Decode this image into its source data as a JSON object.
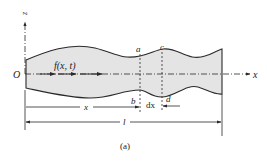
{
  "figure": {
    "caption": "(a)",
    "origin_label": "O",
    "x_axis_label": "x",
    "z_axis_label": "z",
    "force_label": "f(x, t)",
    "section_labels": {
      "a": "a",
      "b": "b",
      "c": "c",
      "d": "d"
    },
    "dimension_labels": {
      "position": "x",
      "element_width": "dx",
      "length": "l"
    }
  },
  "colors": {
    "bar_fill": "#e4e4e4",
    "stroke": "#2a2a2a",
    "background": "#ffffff"
  }
}
